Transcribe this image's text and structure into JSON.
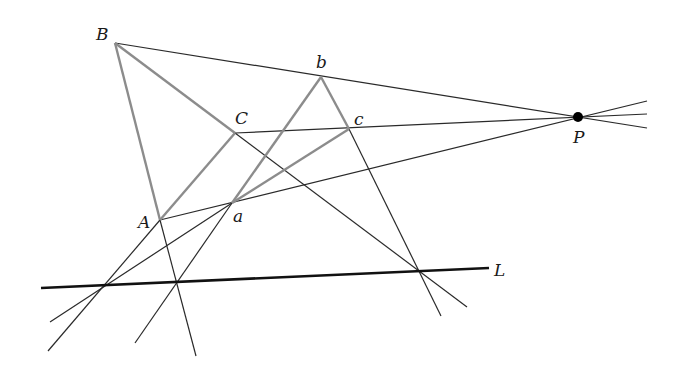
{
  "colors": {
    "thin_line": "#2a2a2a",
    "triangle_edge": "#8c8c8c",
    "axis_line": "#111111",
    "point": "#000000"
  },
  "labels": {
    "B": "B",
    "C": "C",
    "A": "A",
    "b": "b",
    "c": "c",
    "a": "a",
    "P": "P",
    "L": "L"
  },
  "points": {
    "A": [
      160,
      220
    ],
    "B": [
      115,
      43
    ],
    "C": [
      235,
      133
    ],
    "a": [
      232,
      203
    ],
    "b": [
      321,
      77
    ],
    "c": [
      349,
      129
    ],
    "P": [
      578,
      117
    ]
  }
}
